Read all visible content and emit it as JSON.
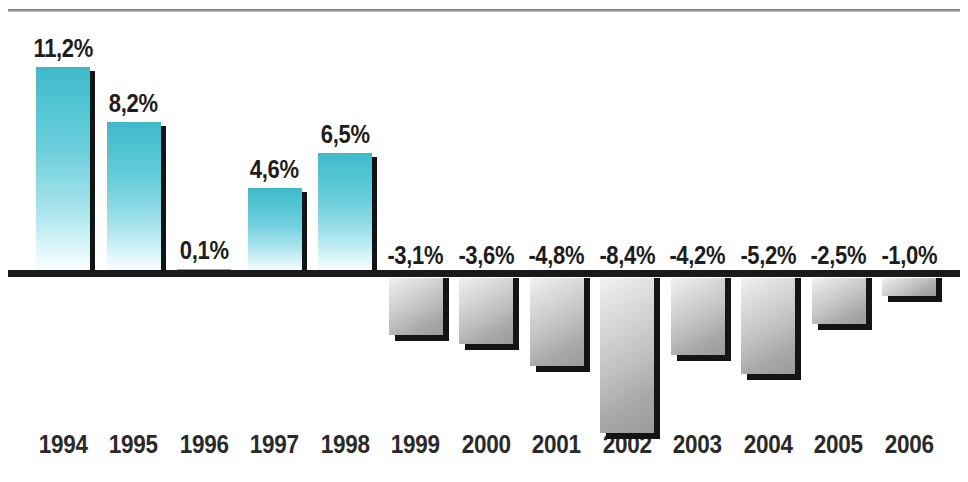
{
  "header": {
    "title_partial": "",
    "rule": "horizontal-rule"
  },
  "chart_data": {
    "type": "bar",
    "title": "",
    "xlabel": "",
    "ylabel": "",
    "grid": false,
    "legend": "none",
    "axis": {
      "zero_line": 0,
      "ylim": [
        -9.0,
        12.0
      ],
      "decimal_separator": ","
    },
    "categories": [
      "1994",
      "1995",
      "1996",
      "1997",
      "1998",
      "1999",
      "2000",
      "2001",
      "2002",
      "2003",
      "2004",
      "2005",
      "2006"
    ],
    "values": [
      11.2,
      8.2,
      0.1,
      4.6,
      6.5,
      -3.1,
      -3.6,
      -4.8,
      -8.4,
      -4.2,
      -5.2,
      -2.5,
      -1.0
    ],
    "value_labels": [
      "11,2%",
      "8,2%",
      "0,1%",
      "4,6%",
      "6,5%",
      "-3,1%",
      "-3,6%",
      "-4,8%",
      "-8,4%",
      "-4,2%",
      "-5,2%",
      "-2,5%",
      "-1,0%"
    ],
    "colors": {
      "positive": "#45bfce",
      "positive_fade": "#ffffff",
      "negative_light": "#f2f2f2",
      "negative_dark": "#9a9a9a",
      "shadow": "#141414",
      "axis": "#1a1a1a",
      "label": "#1d1d1d",
      "background": "#ffffff"
    }
  }
}
